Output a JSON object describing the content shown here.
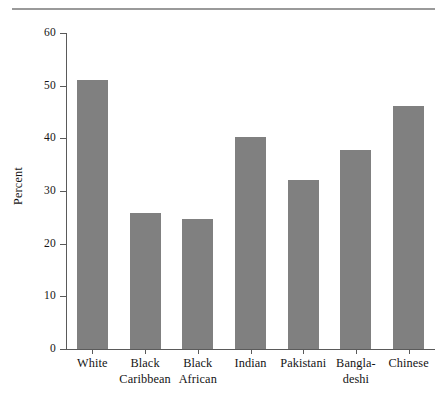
{
  "chart_data": {
    "type": "bar",
    "title": "",
    "subtitle": "",
    "xlabel": "",
    "ylabel": "Percent",
    "categories": [
      "White",
      "Black Caribbean",
      "Black African",
      "Indian",
      "Pakistani",
      "Bangladeshi",
      "Chinese"
    ],
    "category_label_lines": [
      [
        "White"
      ],
      [
        "Black",
        "Caribbean"
      ],
      [
        "Black",
        "African"
      ],
      [
        "Indian"
      ],
      [
        "Pakistani"
      ],
      [
        "Bangla-",
        "deshi"
      ],
      [
        "Chinese"
      ]
    ],
    "values": [
      51.0,
      25.8,
      24.7,
      40.3,
      32.1,
      37.8,
      46.1
    ],
    "ylim": [
      0,
      60
    ],
    "ytick_values": [
      0,
      10,
      20,
      30,
      40,
      50,
      60
    ],
    "ytick_labels": [
      "0",
      "10",
      "20",
      "30",
      "40",
      "50",
      "60"
    ],
    "grid": false,
    "legend": null,
    "legend_position": "none",
    "bar_color": "#808080",
    "axis_color": "#5a5a5a",
    "rule_color": "#9a9a9a",
    "text_color": "#141414"
  }
}
